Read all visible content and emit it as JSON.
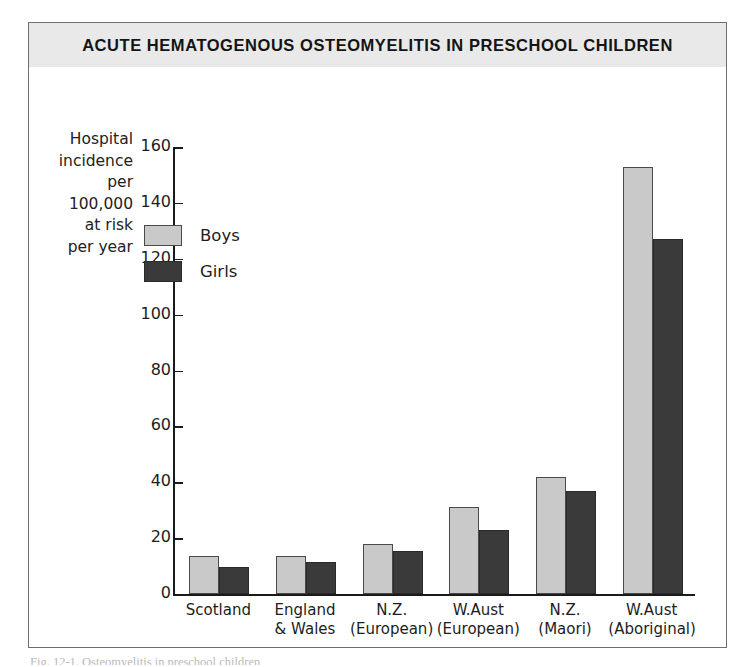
{
  "figure": {
    "title": "ACUTE HEMATOGENOUS OSTEOMYELITIS IN PRESCHOOL CHILDREN",
    "caption_partial": "Fig. 12-1. Osteomyelitis in preschool children"
  },
  "colors": {
    "boys": "#c9c9c9",
    "girls": "#3a3a3a",
    "title_band": "#e9e9e9",
    "frame": "#6f6f6f",
    "axis": "#1a1a1a"
  },
  "chart_data": {
    "type": "bar",
    "title": "ACUTE HEMATOGENOUS OSTEOMYELITIS IN PRESCHOOL CHILDREN",
    "xlabel": "",
    "ylabel": "Hospital\nincidence\nper\n100,000\nat risk\nper year",
    "categories": [
      "Scotland",
      "England\n& Wales",
      "N.Z.\n(European)",
      "W.Aust\n(European)",
      "N.Z.\n(Maori)",
      "W.Aust\n(Aboriginal)"
    ],
    "series": [
      {
        "name": "Boys",
        "values": [
          13.5,
          13.5,
          18,
          31,
          42,
          153
        ]
      },
      {
        "name": "Girls",
        "values": [
          9.5,
          11.5,
          15.5,
          23,
          37,
          127
        ]
      }
    ],
    "ylim": [
      0,
      160
    ],
    "yticks": [
      0,
      20,
      40,
      60,
      80,
      100,
      120,
      140,
      160
    ],
    "ytick_labels": [
      "0",
      "20",
      "40",
      "60",
      "80",
      "100",
      "120",
      "140",
      "160"
    ],
    "grid": false,
    "legend_position": "upper-left-inside"
  }
}
